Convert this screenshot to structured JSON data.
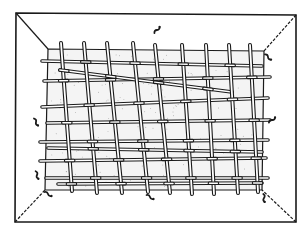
{
  "figure": {
    "width": 306,
    "height": 236,
    "background": "#ffffff",
    "ink": "#1a1a1a",
    "floor_fill": "#f4f4f4",
    "outer_frame": {
      "tl": [
        16,
        13
      ],
      "tr": [
        296,
        15
      ],
      "br": [
        296,
        222
      ],
      "bl": [
        15,
        222
      ]
    },
    "inner_rect": {
      "tl": [
        48,
        49
      ],
      "tr": [
        264,
        51
      ],
      "br": [
        262,
        190
      ],
      "bl": [
        45,
        190
      ]
    },
    "vertical_rods": [
      {
        "top": [
          61,
          43
        ],
        "bottom": [
          72,
          191
        ]
      },
      {
        "top": [
          84,
          43
        ],
        "bottom": [
          97,
          193
        ]
      },
      {
        "top": [
          107,
          43
        ],
        "bottom": [
          122,
          193
        ]
      },
      {
        "top": [
          133,
          43
        ],
        "bottom": [
          148,
          192
        ]
      },
      {
        "top": [
          155,
          45
        ],
        "bottom": [
          170,
          193
        ]
      },
      {
        "top": [
          182,
          45
        ],
        "bottom": [
          192,
          194
        ]
      },
      {
        "top": [
          206,
          45
        ],
        "bottom": [
          214,
          194
        ]
      },
      {
        "top": [
          229,
          45
        ],
        "bottom": [
          238,
          193
        ]
      },
      {
        "top": [
          250,
          45
        ],
        "bottom": [
          258,
          192
        ]
      }
    ],
    "horizontal_rods": [
      {
        "left": [
          42,
          61
        ],
        "right": [
          262,
          66
        ]
      },
      {
        "left": [
          44,
          81
        ],
        "right": [
          270,
          77
        ]
      },
      {
        "left": [
          42,
          107
        ],
        "right": [
          268,
          98
        ]
      },
      {
        "left": [
          47,
          123
        ],
        "right": [
          270,
          120
        ]
      },
      {
        "left": [
          40,
          142
        ],
        "right": [
          268,
          140
        ]
      },
      {
        "left": [
          40,
          161
        ],
        "right": [
          266,
          158
        ]
      },
      {
        "left": [
          46,
          178
        ],
        "right": [
          268,
          178
        ]
      },
      {
        "left": [
          60,
          70
        ],
        "right": [
          232,
          92
        ]
      },
      {
        "left": [
          48,
          148
        ],
        "right": [
          262,
          152
        ]
      },
      {
        "left": [
          58,
          184
        ],
        "right": [
          262,
          183
        ]
      }
    ],
    "critters": [
      {
        "label": "worm",
        "x": 157,
        "y": 30,
        "rot": -50
      },
      {
        "label": "worm",
        "x": 268,
        "y": 57,
        "rot": 40
      },
      {
        "label": "worm",
        "x": 272,
        "y": 120,
        "rot": -40
      },
      {
        "label": "worm",
        "x": 36,
        "y": 122,
        "rot": 60
      },
      {
        "label": "worm",
        "x": 37,
        "y": 175,
        "rot": 70
      },
      {
        "label": "worm",
        "x": 48,
        "y": 194,
        "rot": 30
      },
      {
        "label": "worm",
        "x": 150,
        "y": 197,
        "rot": 30
      },
      {
        "label": "worm",
        "x": 264,
        "y": 198,
        "rot": 80
      }
    ]
  }
}
